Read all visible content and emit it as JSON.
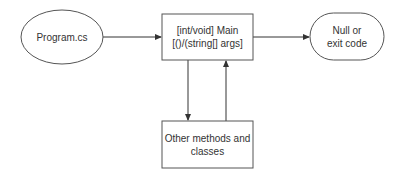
{
  "diagram": {
    "nodes": [
      {
        "id": "program",
        "shape": "ellipse",
        "lines": [
          "Program.cs"
        ]
      },
      {
        "id": "main",
        "shape": "rectangle",
        "lines": [
          "[int/void] Main",
          "[()/(string[] args]"
        ]
      },
      {
        "id": "result",
        "shape": "stadium",
        "lines": [
          "Null or",
          "exit code"
        ]
      },
      {
        "id": "other",
        "shape": "rectangle",
        "lines": [
          "Other methods and",
          "classes"
        ]
      }
    ],
    "edges": [
      {
        "from": "program",
        "to": "main"
      },
      {
        "from": "main",
        "to": "result"
      },
      {
        "from": "main",
        "to": "other"
      },
      {
        "from": "other",
        "to": "main"
      }
    ],
    "colors": {
      "stroke": "#555555",
      "text": "#333333",
      "background": "#ffffff"
    }
  }
}
